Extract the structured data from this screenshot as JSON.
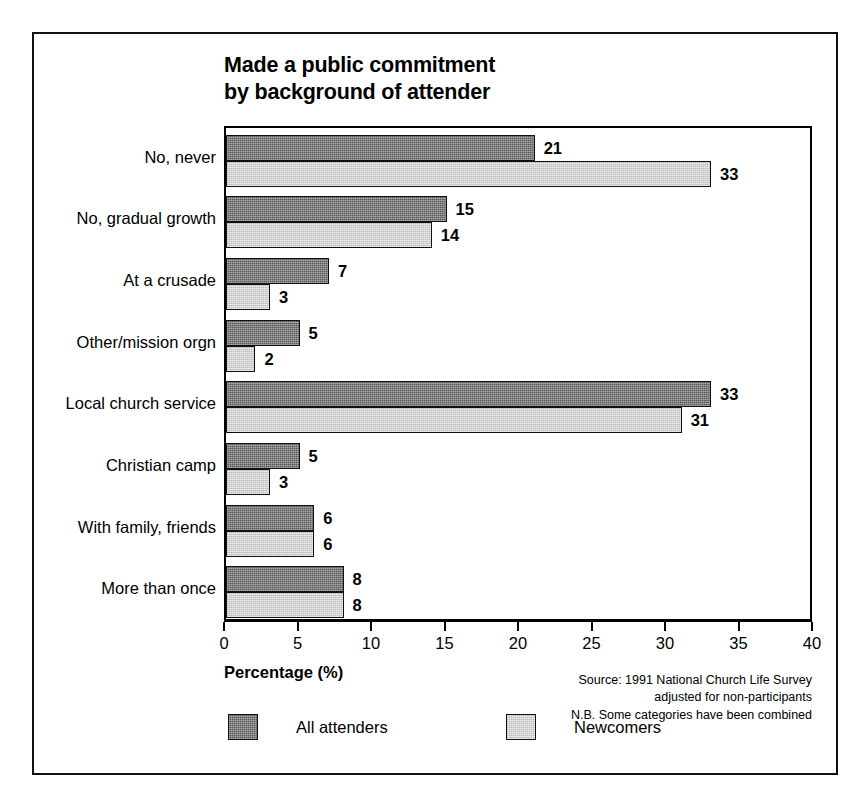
{
  "chart_data": {
    "type": "bar",
    "orientation": "horizontal",
    "title": "Made a public commitment\nby background of attender",
    "xlabel": "Percentage (%)",
    "ylabel": "",
    "xlim": [
      0,
      40
    ],
    "xticks": [
      0,
      5,
      10,
      15,
      20,
      25,
      30,
      35,
      40
    ],
    "xtick_labels": [
      "0",
      "5",
      "10",
      "15",
      "20",
      "25",
      "30",
      "35",
      "40"
    ],
    "grid": false,
    "legend_position": "bottom-left",
    "categories": [
      "No, never",
      "No, gradual growth",
      "At a crusade",
      "Other/mission orgn",
      "Local church service",
      "Christian camp",
      "With family, friends",
      "More than once"
    ],
    "series": [
      {
        "name": "All attenders",
        "color": "#59595c",
        "values": [
          21,
          15,
          7,
          5,
          33,
          5,
          6,
          8
        ]
      },
      {
        "name": "Newcomers",
        "color": "#d2d2d2",
        "values": [
          33,
          14,
          3,
          2,
          31,
          3,
          6,
          8
        ]
      }
    ],
    "annotations": [
      "Source: 1991 National Church Life Survey",
      "adjusted for non-participants",
      "N.B. Some categories have been combined"
    ]
  },
  "source_note": "Source: 1991 National Church Life Survey\nadjusted for non-participants\nN.B. Some categories have been combined"
}
